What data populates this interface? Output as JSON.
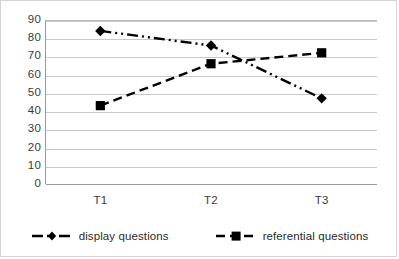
{
  "chart_data": {
    "type": "line",
    "title": "",
    "xlabel": "",
    "ylabel": "",
    "categories": [
      "T1",
      "T2",
      "T3"
    ],
    "series": [
      {
        "name": "display questions",
        "marker": "diamond",
        "linestyle": "dash-dot-dot",
        "color": "#000000",
        "values": [
          84,
          76,
          47
        ]
      },
      {
        "name": "referential questions",
        "marker": "square",
        "linestyle": "dashed",
        "color": "#000000",
        "values": [
          43,
          66,
          72
        ]
      }
    ],
    "ylim": [
      0,
      90
    ],
    "ytick_values": [
      0,
      10,
      20,
      30,
      40,
      50,
      60,
      70,
      80,
      90
    ],
    "ytick_labels": [
      "0",
      "10",
      "20",
      "30",
      "40",
      "50",
      "60",
      "70",
      "80",
      "90"
    ],
    "grid": true,
    "legend_position": "bottom",
    "gridline_color": "#c9c9c9",
    "axis_color": "#9a9a9a",
    "border_color": "#d4d4d4"
  },
  "legend": {
    "items": [
      {
        "label": "display questions",
        "key_name": "diamond-dashdot-key"
      },
      {
        "label": "referential questions",
        "key_name": "square-dashed-key"
      }
    ]
  }
}
